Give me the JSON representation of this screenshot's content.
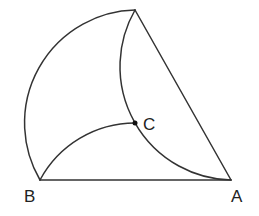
{
  "diagram": {
    "points": {
      "A": {
        "label": "A",
        "x": 231,
        "y": 180
      },
      "B": {
        "label": "B",
        "x": 40,
        "y": 180
      },
      "C": {
        "label": "C",
        "x": 135,
        "y": 123
      },
      "T": {
        "x": 135,
        "y": 10
      }
    },
    "segments": [
      {
        "from": "B",
        "to": "A"
      },
      {
        "from": "T",
        "to": "A"
      }
    ],
    "arcs": [
      {
        "name": "outer-arc",
        "from": "T",
        "to": "B",
        "center": "C",
        "radius": 113
      },
      {
        "name": "inner-arc-BC",
        "from": "B",
        "to": "C",
        "radius": 108
      },
      {
        "name": "middle-arc-TCA",
        "from": "T",
        "through": "C",
        "to": "A",
        "radius": 114
      }
    ],
    "stroke_color": "#333333",
    "labels": {
      "a": "A",
      "b": "B",
      "c": "C"
    }
  }
}
